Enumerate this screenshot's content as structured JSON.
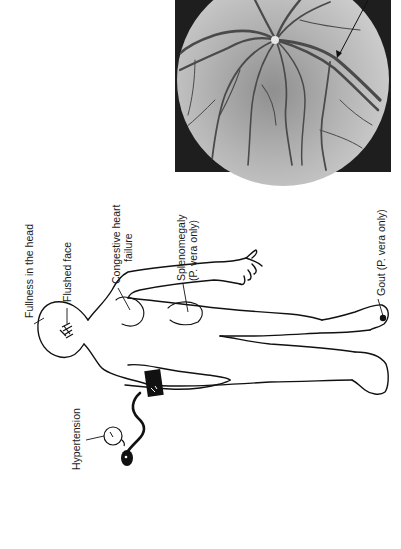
{
  "figure": {
    "orientation": "rotated-90",
    "labels": {
      "fullness_in_head": "Fullness in the head",
      "flushed_face": "Flushed face",
      "congestive_heart_failure_line1": "Congestive heart",
      "congestive_heart_failure_line2": "failure",
      "splenomegaly_line1": "Splenomegaly",
      "splenomegaly_line2": "(P. vera only)",
      "gout": "Gout (P. vera only)",
      "hypertension": "Hypertension"
    },
    "colors": {
      "line": "#111111",
      "fundus_background": "#1e1e1e",
      "fundus_field": "#b9b9b9",
      "fundus_vessel": "#555555",
      "page": "#ffffff"
    }
  }
}
